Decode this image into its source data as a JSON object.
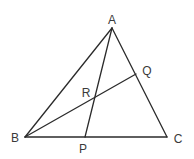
{
  "diagram": {
    "type": "triangle-with-cevians",
    "points": {
      "A": {
        "label": "A",
        "x": 112,
        "y": 28,
        "lx": 112,
        "ly": 24
      },
      "B": {
        "label": "B",
        "x": 25,
        "y": 137,
        "lx": 15,
        "ly": 142
      },
      "C": {
        "label": "C",
        "x": 167,
        "y": 137,
        "lx": 178,
        "ly": 143
      },
      "P": {
        "label": "P",
        "x": 85,
        "y": 137,
        "lx": 83,
        "ly": 153
      },
      "Q": {
        "label": "Q",
        "x": 136,
        "y": 74,
        "lx": 147,
        "ly": 75
      },
      "R": {
        "label": "R",
        "x": 95,
        "y": 97,
        "lx": 86,
        "ly": 97
      }
    },
    "segments": [
      [
        "A",
        "B"
      ],
      [
        "B",
        "C"
      ],
      [
        "C",
        "A"
      ],
      [
        "A",
        "P"
      ],
      [
        "B",
        "Q"
      ]
    ],
    "stroke_color": "#2b2b2b",
    "label_color": "#3a3a3a"
  }
}
